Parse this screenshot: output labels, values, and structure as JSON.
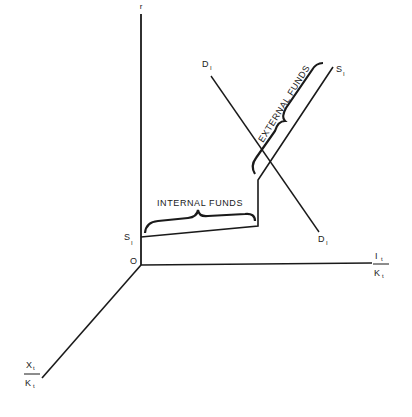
{
  "diagram": {
    "type": "3d-axis investment supply-demand diagram",
    "axes": {
      "vertical": {
        "label": "r"
      },
      "horizontal": {
        "label_num": "I",
        "label_num_sub": "t",
        "label_den": "K",
        "label_den_sub": "t"
      },
      "depth": {
        "label_num": "X",
        "label_num_sub": "t",
        "label_den": "K",
        "label_den_sub": "t"
      },
      "origin": {
        "label": "O"
      }
    },
    "curves": {
      "supply": {
        "label_start": "S",
        "label_start_sub": "I",
        "label_end": "S",
        "label_end_sub": "I"
      },
      "demand": {
        "label_start": "D",
        "label_start_sub": "I",
        "label_end": "D",
        "label_end_sub": "I"
      }
    },
    "annotations": {
      "internal_funds": "INTERNAL FUNDS",
      "external_funds": "EXTERNAL FUNDS"
    },
    "colors": {
      "ink": "#1a1a1a",
      "background": "#ffffff"
    }
  }
}
